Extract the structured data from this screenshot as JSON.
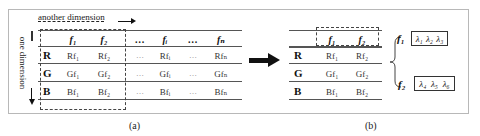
{
  "panel_a": {
    "top_axis_label": "another dimension",
    "side_axis_label": "one dimension",
    "columns": [
      "",
      "f₁",
      "f₂",
      "…",
      "fᵢ",
      "…",
      "fₙ"
    ],
    "rows": [
      {
        "label": "R",
        "cells": [
          "Rf₁",
          "Rf₂",
          "…",
          "Rfᵢ",
          "…",
          "Rfₙ"
        ]
      },
      {
        "label": "G",
        "cells": [
          "Gf₁",
          "Gf₂",
          "…",
          "Gfᵢ",
          "…",
          "Gfₙ"
        ]
      },
      {
        "label": "B",
        "cells": [
          "Bf₁",
          "Bf₂",
          "…",
          "Bfᵢ",
          "…",
          "Bfₙ"
        ]
      }
    ],
    "caption": "(a)"
  },
  "panel_b": {
    "columns": [
      "",
      "f₁",
      "f₂"
    ],
    "rows": [
      {
        "label": "R",
        "cells": [
          "Rf₁",
          "Rf₂"
        ]
      },
      {
        "label": "G",
        "cells": [
          "Gf₁",
          "Gf₂"
        ]
      },
      {
        "label": "B",
        "cells": [
          "Bf₁",
          "Bf₂"
        ]
      }
    ],
    "groups": [
      {
        "label": "f₁",
        "lambdas": [
          "λ₁",
          "λ₂",
          "λ₃"
        ]
      },
      {
        "label": "f₂",
        "lambdas": [
          "λ₄",
          "λ₅",
          "λ₆"
        ]
      }
    ],
    "caption": "(b)"
  },
  "colors": {
    "frame": "#b8b8b8",
    "lines": "#555555",
    "text": "#1a1a1a"
  }
}
